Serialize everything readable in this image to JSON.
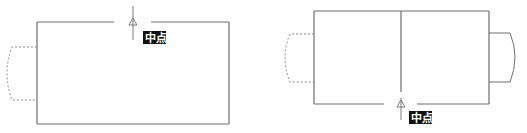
{
  "figures": [
    {
      "name": "left-figure",
      "snap_label": "中点",
      "snap_position": "top-edge-midpoint",
      "ghost_tab": "left-dashed"
    },
    {
      "name": "right-figure",
      "snap_label": "中点",
      "snap_position": "bottom-edge-midpoint",
      "ghost_tab": "left-dashed",
      "solid_tab": "right"
    }
  ],
  "colors": {
    "edge": "#6e6e6e",
    "tooltip_bg": "#111111",
    "tooltip_text": "#ffffff"
  }
}
